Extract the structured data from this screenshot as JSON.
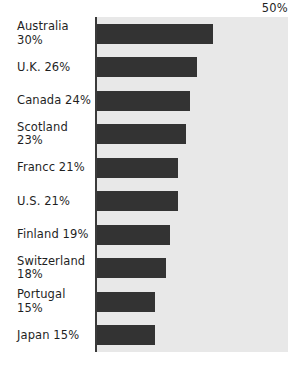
{
  "chart_data": {
    "type": "bar",
    "orientation": "horizontal",
    "title": "",
    "xlabel": "",
    "ylabel": "",
    "xlim": [
      0,
      50
    ],
    "axis_max_label": "50%",
    "grid": false,
    "legend": null,
    "bar_color": "#333333",
    "plot_background": "#e8e8e8",
    "page_background": "#ffffff",
    "categories": [
      "Australia",
      "U.K.",
      "Canada",
      "Scotland",
      "Francc",
      "U.S.",
      "Finland",
      "Switzerland",
      "Portugal",
      "Japan"
    ],
    "values": [
      30,
      26,
      24,
      23,
      21,
      21,
      19,
      18,
      15,
      15
    ],
    "rows": [
      {
        "label": "Australia 30%",
        "label_lines": [
          "Australia 30%"
        ],
        "value": 30
      },
      {
        "label": "U.K. 26%",
        "label_lines": [
          "U.K. 26%"
        ],
        "value": 26
      },
      {
        "label": "Canada 24%",
        "label_lines": [
          "Canada 24%"
        ],
        "value": 24
      },
      {
        "label": "Scotland 23%",
        "label_lines": [
          "Scotland 23%"
        ],
        "value": 23
      },
      {
        "label": "Francc 21%",
        "label_lines": [
          "Francc 21%"
        ],
        "value": 21
      },
      {
        "label": "U.S. 21%",
        "label_lines": [
          "U.S. 21%"
        ],
        "value": 21
      },
      {
        "label": "Finland 19%",
        "label_lines": [
          "Finland 19%"
        ],
        "value": 19
      },
      {
        "label": "Switzerland 18%",
        "label_lines": [
          "Switzerland",
          "18%"
        ],
        "value": 18
      },
      {
        "label": "Portugal 15%",
        "label_lines": [
          "Portugal 15%"
        ],
        "value": 15
      },
      {
        "label": "Japan 15%",
        "label_lines": [
          "Japan 15%"
        ],
        "value": 15
      }
    ]
  }
}
